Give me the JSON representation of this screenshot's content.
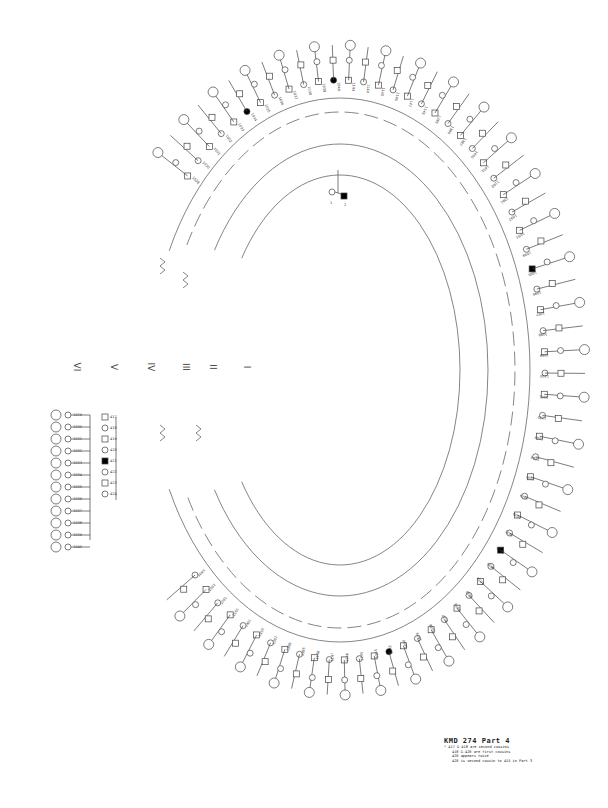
{
  "title": "KMD 274  Part 4",
  "legend": {
    "title": "KMD 274  Part 4",
    "notes": [
      "* 417 & 418 are second cousins",
      "418 & 420 are first cousins",
      "420 appears twice",
      "420 is second cousin to 415 in Part 3"
    ]
  },
  "generations": [
    {
      "label": "VI",
      "x": 73,
      "y": 362
    },
    {
      "label": "V",
      "x": 111,
      "y": 362
    },
    {
      "label": "IV",
      "x": 147,
      "y": 362
    },
    {
      "label": "III",
      "x": 182,
      "y": 362
    },
    {
      "label": "II",
      "x": 210,
      "y": 362
    },
    {
      "label": "I",
      "x": 246,
      "y": 362
    }
  ],
  "colors": {
    "line": "#555555",
    "affected": "#000000",
    "unaffected_fill": "#ffffff"
  },
  "arcs": {
    "center": [
      340,
      370
    ],
    "rings": [
      {
        "rx": 120,
        "ry": 195,
        "dash": "none"
      },
      {
        "rx": 148,
        "ry": 226,
        "dash": "none"
      },
      {
        "rx": 175,
        "ry": 258,
        "dash": "14,6"
      },
      {
        "rx": 190,
        "ry": 272,
        "dash": "none"
      }
    ]
  },
  "founders": {
    "label_left": "1",
    "label_right": "2"
  },
  "left_group": {
    "ids": [
      "1029",
      "1030",
      "1031",
      "1032",
      "1033",
      "1034",
      "1035",
      "1036",
      "1037",
      "1038",
      "1039",
      "1040"
    ],
    "spouses": [
      "417",
      "418",
      "419",
      "420",
      "421",
      "422",
      "423",
      "424"
    ],
    "extra": [
      "1378",
      "1379",
      "1380"
    ]
  },
  "upper_left_group": {
    "ids": [
      "1143",
      "1144",
      "1145",
      "1146",
      "1147",
      "1148",
      "1385",
      "1386",
      "1387",
      "1450",
      "1451",
      "1160"
    ]
  },
  "right_group": {
    "ids": [
      "1091",
      "1092",
      "1093",
      "1094",
      "1095",
      "1096",
      "1097",
      "1098",
      "1099",
      "1100",
      "1101",
      "1102",
      "1103",
      "1104",
      "1105"
    ]
  }
}
